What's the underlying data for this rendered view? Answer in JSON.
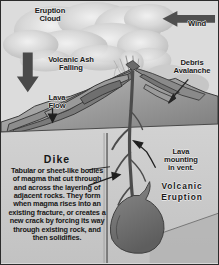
{
  "figure": {
    "palette": {
      "sky": "#d9d9d9",
      "cloud": "#cfcfcf",
      "ground_cross_section": "#c9c9c9",
      "magma": "#6b6b6b",
      "edge": "#2b2b2b",
      "text": "#171717"
    }
  },
  "labels": {
    "eruption_cloud": "Eruption\nCloud",
    "wind": "Wind",
    "volcanic_ash_falling": "Volcanic Ash\nFalling",
    "debris_avalanche": "Debris\nAvalanche",
    "lava_flow": "Lava\nFlow",
    "lava_mounting_in_vent": "Lava\nmounting\nin vent.",
    "volcanic_eruption": "Volcanic\nEruption"
  },
  "dike": {
    "title": "Dike",
    "body": "Tabular or sheet-like bodies of magma that cut through and across the layering of adjacent rocks. They form when magma rises into an existing fracture, or creates a new crack by forcing its way through existing rock, and then solidifies."
  },
  "icons": {
    "wind_arrow": "arrow-left-icon",
    "ash_arrow": "arrow-down-icon",
    "debris_arrow": "arrow-diagonal-down-left-icon",
    "lava_flow_arrow": "arrow-down-icon",
    "lava_vent_arrow": "arrow-up-left-icon",
    "dike_arrow": "arrow-right-icon"
  }
}
